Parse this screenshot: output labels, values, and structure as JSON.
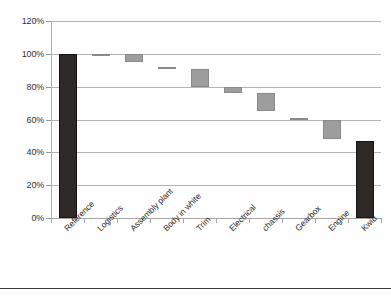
{
  "chart_data": {
    "type": "bar",
    "chart_style": "waterfall",
    "title": "",
    "subtitle": "",
    "xlabel": "",
    "ylabel": "",
    "ylim": [
      0,
      120
    ],
    "ytick_values": [
      0,
      20,
      40,
      60,
      80,
      100,
      120
    ],
    "ytick_labels": [
      "0%",
      "20%",
      "40%",
      "60%",
      "80%",
      "100%",
      "120%"
    ],
    "grid": true,
    "legend": false,
    "legend_position": "none",
    "annotations": [],
    "categories": [
      "Reference",
      "Logistics",
      "Assembly plant",
      "Body in white",
      "Trim",
      "Electrical",
      "chassis",
      "Gearbox",
      "Engine",
      "Kwid"
    ],
    "bars": [
      {
        "category": "Reference",
        "kind": "total",
        "base": 0,
        "top": 100,
        "value": 100,
        "color": "#2e2926"
      },
      {
        "category": "Logistics",
        "kind": "delta",
        "base": 99.5,
        "top": 100,
        "value": -0.5,
        "color": "#9d9d9d"
      },
      {
        "category": "Assembly plant",
        "kind": "delta",
        "base": 95,
        "top": 100,
        "value": -5,
        "color": "#9d9d9d"
      },
      {
        "category": "Body in white",
        "kind": "delta",
        "base": 91.5,
        "top": 92,
        "value": -0.5,
        "color": "#9d9d9d"
      },
      {
        "category": "Trim",
        "kind": "delta",
        "base": 80,
        "top": 91,
        "value": -11,
        "color": "#9d9d9d"
      },
      {
        "category": "Electrical",
        "kind": "delta",
        "base": 76,
        "top": 80,
        "value": -4,
        "color": "#9d9d9d"
      },
      {
        "category": "chassis",
        "kind": "delta",
        "base": 65,
        "top": 76,
        "value": -11,
        "color": "#9d9d9d"
      },
      {
        "category": "Gearbox",
        "kind": "delta",
        "base": 60.5,
        "top": 61,
        "value": -0.5,
        "color": "#9d9d9d"
      },
      {
        "category": "Engine",
        "kind": "delta",
        "base": 48,
        "top": 60,
        "value": -12,
        "color": "#9d9d9d"
      },
      {
        "category": "Kwid",
        "kind": "total",
        "base": 0,
        "top": 47,
        "value": 47,
        "color": "#2e2926"
      }
    ],
    "colors": {
      "total_bar": "#2e2926",
      "delta_bar": "#9d9d9d",
      "gridline": "#b4b4b4",
      "axis": "#a8a6a4",
      "text": "#2f2c2a"
    }
  }
}
